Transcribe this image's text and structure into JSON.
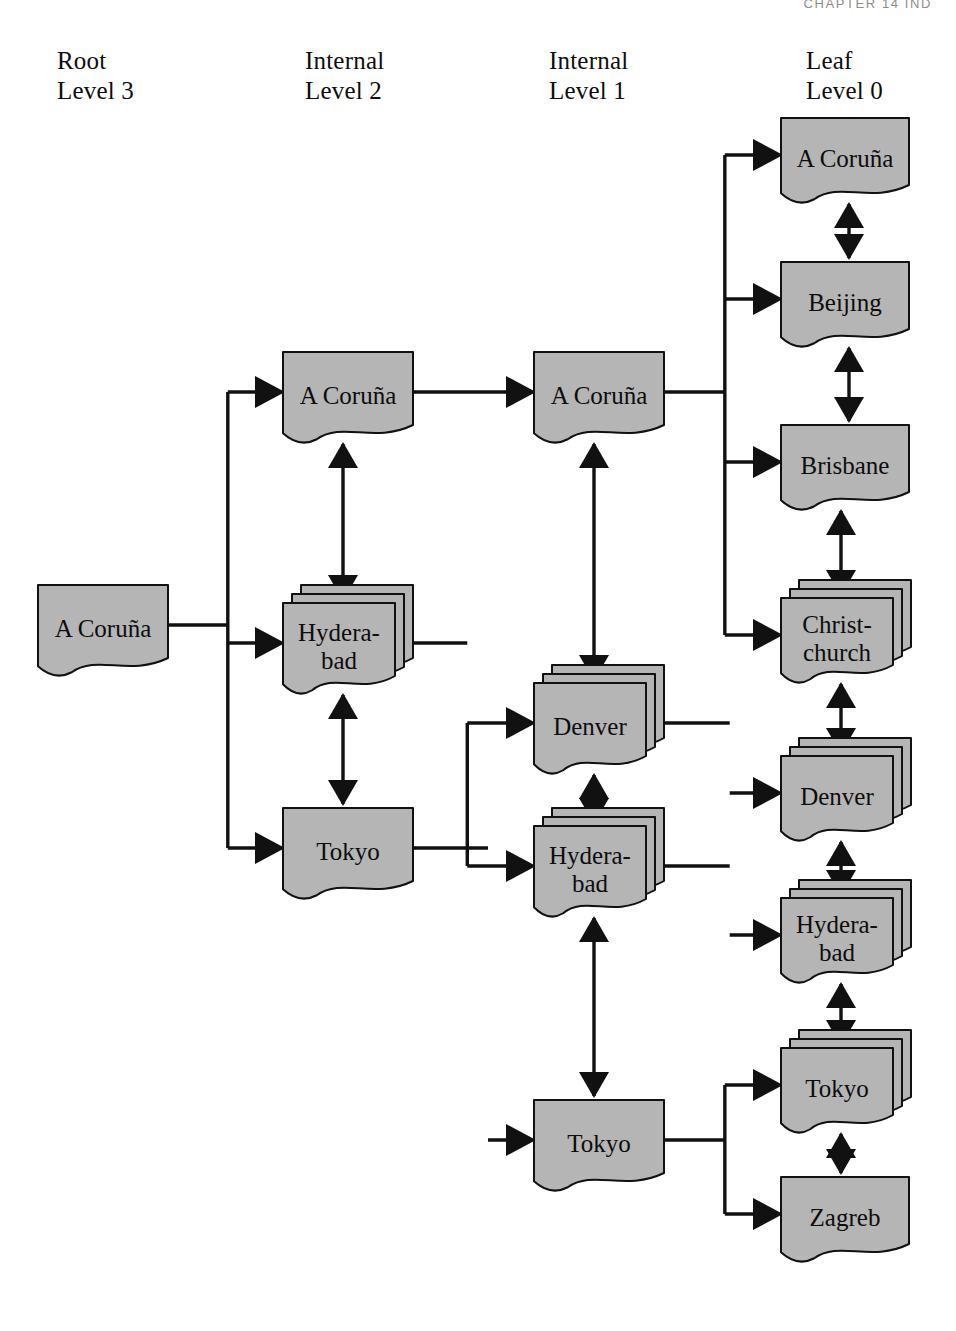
{
  "page": {
    "running_head": "CHAPTER 14   IND",
    "diagram_title": "B-tree index structure with levels"
  },
  "columns": [
    {
      "id": "root",
      "role": "Root",
      "level": "Level 3",
      "x": 57,
      "y": 46
    },
    {
      "id": "internal2",
      "role": "Internal",
      "level": "Level 2",
      "x": 305,
      "y": 46
    },
    {
      "id": "internal1",
      "role": "Internal",
      "level": "Level 1",
      "x": 549,
      "y": 46
    },
    {
      "id": "leaf",
      "role": "Leaf",
      "level": "Level 0",
      "x": 806,
      "y": 46
    }
  ],
  "style": {
    "node_fill": "#b5b5b5",
    "node_stroke": "#111111",
    "wire_color": "#111111",
    "page_background": "#ffffff"
  },
  "nodes": [
    {
      "id": "root-acoruna",
      "label": "A Coruña",
      "column": "root",
      "x": 38,
      "y": 585,
      "w": 130,
      "h": 88,
      "stacked": false
    },
    {
      "id": "l2-acoruna",
      "label": "A Coruña",
      "column": "internal2",
      "x": 283,
      "y": 352,
      "w": 130,
      "h": 88,
      "stacked": false
    },
    {
      "id": "l2-hyderabad",
      "label": "Hydera-bad",
      "column": "internal2",
      "x": 283,
      "y": 585,
      "w": 112,
      "h": 88,
      "stacked": true
    },
    {
      "id": "l2-tokyo",
      "label": "Tokyo",
      "column": "internal2",
      "x": 283,
      "y": 808,
      "w": 130,
      "h": 88,
      "stacked": false
    },
    {
      "id": "l1-acoruna",
      "label": "A Coruña",
      "column": "internal1",
      "x": 534,
      "y": 352,
      "w": 130,
      "h": 88,
      "stacked": false
    },
    {
      "id": "l1-denver",
      "label": "Denver",
      "column": "internal1",
      "x": 534,
      "y": 665,
      "w": 112,
      "h": 88,
      "stacked": true
    },
    {
      "id": "l1-hyderabad",
      "label": "Hydera-bad",
      "column": "internal1",
      "x": 534,
      "y": 808,
      "w": 112,
      "h": 88,
      "stacked": true
    },
    {
      "id": "l1-tokyo",
      "label": "Tokyo",
      "column": "internal1",
      "x": 534,
      "y": 1100,
      "w": 130,
      "h": 88,
      "stacked": false
    },
    {
      "id": "lf-acoruna",
      "label": "A Coruña",
      "column": "leaf",
      "x": 781,
      "y": 118,
      "w": 128,
      "h": 82,
      "stacked": false
    },
    {
      "id": "lf-beijing",
      "label": "Beijing",
      "column": "leaf",
      "x": 781,
      "y": 262,
      "w": 128,
      "h": 82,
      "stacked": false
    },
    {
      "id": "lf-brisbane",
      "label": "Brisbane",
      "column": "leaf",
      "x": 781,
      "y": 425,
      "w": 128,
      "h": 82,
      "stacked": false
    },
    {
      "id": "lf-christchurch",
      "label": "Christ-church",
      "column": "leaf",
      "x": 781,
      "y": 580,
      "w": 112,
      "h": 82,
      "stacked": true
    },
    {
      "id": "lf-denver",
      "label": "Denver",
      "column": "leaf",
      "x": 781,
      "y": 738,
      "w": 112,
      "h": 82,
      "stacked": true
    },
    {
      "id": "lf-hyderabad",
      "label": "Hydera-bad",
      "column": "leaf",
      "x": 781,
      "y": 880,
      "w": 112,
      "h": 82,
      "stacked": true
    },
    {
      "id": "lf-tokyo",
      "label": "Tokyo",
      "column": "leaf",
      "x": 781,
      "y": 1030,
      "w": 112,
      "h": 82,
      "stacked": true
    },
    {
      "id": "lf-zagreb",
      "label": "Zagreb",
      "column": "leaf",
      "x": 781,
      "y": 1177,
      "w": 128,
      "h": 82,
      "stacked": false
    }
  ],
  "parent_edges": [
    {
      "from": "root-acoruna",
      "to": "l2-acoruna"
    },
    {
      "from": "root-acoruna",
      "to": "l2-hyderabad"
    },
    {
      "from": "root-acoruna",
      "to": "l2-tokyo"
    },
    {
      "from": "l2-acoruna",
      "to": "l1-acoruna"
    },
    {
      "from": "l2-hyderabad",
      "to": "l1-denver"
    },
    {
      "from": "l2-hyderabad",
      "to": "l1-hyderabad"
    },
    {
      "from": "l2-tokyo",
      "to": "l1-tokyo"
    },
    {
      "from": "l1-acoruna",
      "to": "lf-acoruna"
    },
    {
      "from": "l1-acoruna",
      "to": "lf-beijing"
    },
    {
      "from": "l1-acoruna",
      "to": "lf-brisbane"
    },
    {
      "from": "l1-acoruna",
      "to": "lf-christchurch"
    },
    {
      "from": "l1-denver",
      "to": "lf-denver"
    },
    {
      "from": "l1-hyderabad",
      "to": "lf-hyderabad"
    },
    {
      "from": "l1-tokyo",
      "to": "lf-tokyo"
    },
    {
      "from": "l1-tokyo",
      "to": "lf-zagreb"
    }
  ],
  "sibling_links": [
    {
      "a": "l2-acoruna",
      "b": "l2-hyderabad"
    },
    {
      "a": "l2-hyderabad",
      "b": "l2-tokyo"
    },
    {
      "a": "l1-acoruna",
      "b": "l1-denver"
    },
    {
      "a": "l1-denver",
      "b": "l1-hyderabad"
    },
    {
      "a": "l1-hyderabad",
      "b": "l1-tokyo"
    },
    {
      "a": "lf-acoruna",
      "b": "lf-beijing"
    },
    {
      "a": "lf-beijing",
      "b": "lf-brisbane"
    },
    {
      "a": "lf-brisbane",
      "b": "lf-christchurch"
    },
    {
      "a": "lf-christchurch",
      "b": "lf-denver"
    },
    {
      "a": "lf-denver",
      "b": "lf-hyderabad"
    },
    {
      "a": "lf-hyderabad",
      "b": "lf-tokyo"
    },
    {
      "a": "lf-tokyo",
      "b": "lf-zagreb"
    }
  ]
}
